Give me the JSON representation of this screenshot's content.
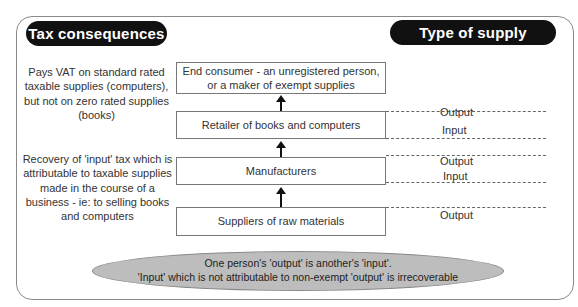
{
  "headers": {
    "tax_consequences": "Tax consequences",
    "type_of_supply": "Type of supply"
  },
  "chain": [
    {
      "label": "End consumer - an unregistered person, or a maker of exempt supplies"
    },
    {
      "label": "Retailer of books and computers"
    },
    {
      "label": "Manufacturers"
    },
    {
      "label": "Suppliers of raw materials"
    }
  ],
  "tax_notes": [
    "Pays VAT on standard rated taxable supplies (computers), but not on zero rated supplies (books)",
    "Recovery of 'input' tax which is attributable to taxable supplies made in the course of a business - ie: to selling books and computers"
  ],
  "supply_labels": {
    "retailer_output": "Output",
    "retailer_input": "Input",
    "manufacturer_output": "Output",
    "manufacturer_input": "Input",
    "supplier_output": "Output"
  },
  "summary": {
    "line1": "One person's 'output' is another's 'input'.",
    "line2": "'Input' which is not attributable to non-exempt 'output' is irrecoverable"
  }
}
